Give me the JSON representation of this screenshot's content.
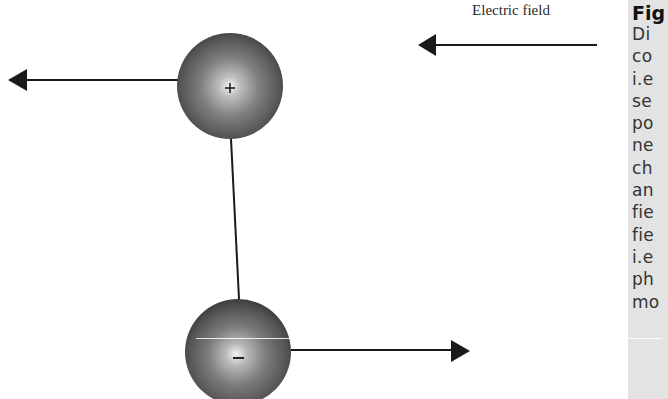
{
  "diagram": {
    "field_label": "Electric field",
    "field_arrow": {
      "direction": "left",
      "x_tail": 597,
      "x_head": 418,
      "y": 45
    },
    "charges": [
      {
        "id": "positive",
        "sign": "+",
        "cx": 230,
        "cy": 86,
        "r": 53,
        "force_direction": "left"
      },
      {
        "id": "negative",
        "sign": "–",
        "cx": 238,
        "cy": 352,
        "r": 53,
        "force_direction": "right"
      }
    ],
    "rod": {
      "x1": 231,
      "y1": 139,
      "x2": 239,
      "y2": 299
    },
    "force_arrows": [
      {
        "id": "force-on-positive",
        "direction": "left",
        "x_tail": 178,
        "x_head": 8,
        "y": 80
      },
      {
        "id": "force-on-negative",
        "direction": "right",
        "x_tail": 291,
        "x_head": 470,
        "y": 350
      }
    ],
    "colors": {
      "sphere_dark": "#3d3d3d",
      "sphere_mid": "#7a7a7a",
      "sphere_highlight": "#f4f4f4",
      "line": "#1a1a1a",
      "caption_bg": "#e3e3e3"
    }
  },
  "caption": {
    "title": "Fig",
    "lines": [
      "Di",
      "co",
      "i.e",
      "se",
      "po",
      "ne",
      "ch",
      "an",
      "fie",
      "fie",
      "i.e",
      "ph",
      "mo"
    ]
  }
}
